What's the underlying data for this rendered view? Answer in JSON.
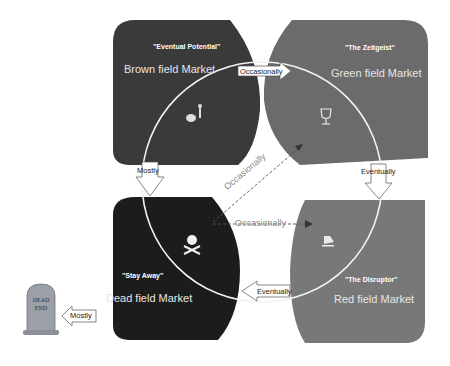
{
  "quadrants": {
    "brown": {
      "tagline": "\"Eventual Potential\"",
      "market": "Brown field Market",
      "color": "#3a3a3a",
      "icon": "cart-person-icon"
    },
    "green": {
      "tagline": "\"The Zeitgeist\"",
      "market": "Green field Market",
      "color": "#6b6b6b",
      "icon": "trophy-icon"
    },
    "dead": {
      "tagline": "\"Stay Away\"",
      "market": "Dead field  Market",
      "color": "#1c1c1c",
      "icon": "skull-crossbones-icon"
    },
    "red": {
      "tagline": "\"The Disruptor\"",
      "market": "Red field Market",
      "color": "#787878",
      "icon": "disruptor-icon"
    }
  },
  "arrows": {
    "brown_to_green": "Occasionally",
    "brown_to_dead": "Mostly",
    "green_to_red": "Eventually",
    "red_to_dead": "Eventually",
    "dead_to_deadend": "Mostly",
    "dead_to_green_dashed": "Occasionally",
    "dead_to_red_dashed": "Occasionally"
  },
  "tombstone": {
    "line1": "DEAD",
    "line2": "END"
  }
}
